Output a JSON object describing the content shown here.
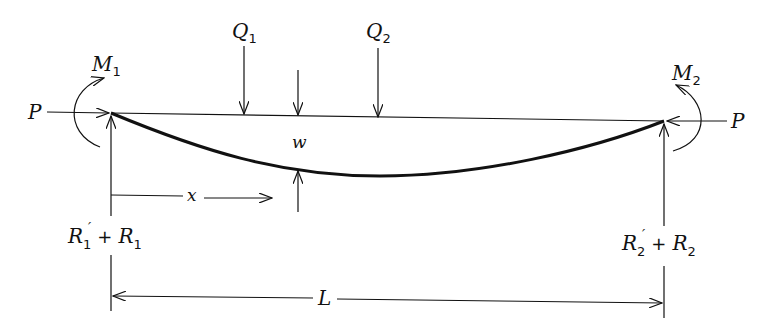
{
  "diagram": {
    "type": "beam-column with end moments, axial load and transverse loads",
    "labels": {
      "axial_left": "P",
      "axial_right": "P",
      "moment_left": {
        "base": "M",
        "sub": "1"
      },
      "moment_right": {
        "base": "M",
        "sub": "2"
      },
      "load_1": {
        "base": "Q",
        "sub": "1"
      },
      "load_2": {
        "base": "Q",
        "sub": "2"
      },
      "deflection": "w",
      "position": "x",
      "length": "L",
      "reaction_left": {
        "prime_base": "R",
        "prime_sub": "1",
        "plus": "+",
        "base": "R",
        "sub": "1"
      },
      "reaction_right": {
        "prime_base": "R",
        "prime_sub": "2",
        "plus": "+",
        "base": "R",
        "sub": "2"
      }
    },
    "colors": {
      "ink": "#111111",
      "background": "#ffffff"
    }
  }
}
